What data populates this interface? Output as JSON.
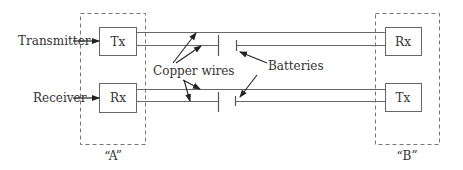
{
  "diagram": {
    "stations": [
      {
        "id": "A",
        "label": "“A”",
        "top_device": "Tx",
        "bottom_device": "Rx"
      },
      {
        "id": "B",
        "label": "“B”",
        "top_device": "Rx",
        "bottom_device": "Tx"
      }
    ],
    "side_labels": {
      "transmitter": "Transmitter",
      "receiver": "Receiver"
    },
    "annotations": {
      "copper_wires": "Copper wires",
      "batteries": "Batteries"
    },
    "colors": {
      "line": "#555555",
      "dash": "#777777",
      "text": "#333333"
    }
  }
}
